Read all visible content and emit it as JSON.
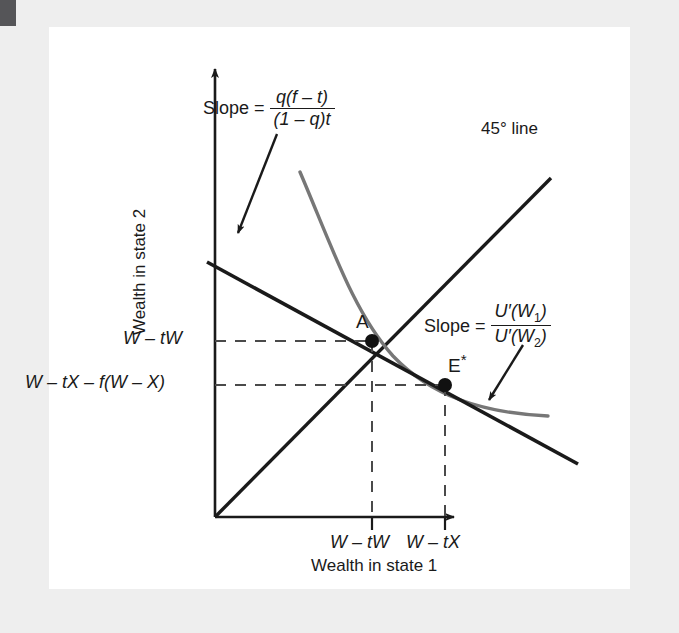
{
  "figure": {
    "type": "economics-diagram",
    "axes": {
      "x_title": "Wealth in state 1",
      "y_title": "Wealth in state 2",
      "x_ticks": [
        {
          "label_plain": "W – tW",
          "label_parts": [
            "W",
            "–",
            "t",
            "W"
          ],
          "x_px": 372
        },
        {
          "label_plain": "W – tX",
          "label_parts": [
            "W",
            "–",
            "t",
            "X"
          ],
          "x_px": 445
        }
      ],
      "y_ticks": [
        {
          "label_plain": "W – tW",
          "y_px": 341
        },
        {
          "label_plain": "W – tX – f(W – X)",
          "y_px": 385
        }
      ]
    },
    "lines": [
      {
        "name": "45-degree-line",
        "label": "45° line",
        "color": "#1a1a1a",
        "from": [
          215,
          517
        ],
        "to": [
          551,
          178
        ]
      },
      {
        "name": "budget-line",
        "color": "#1a1a1a",
        "from": [
          207,
          262
        ],
        "to": [
          578,
          464
        ]
      },
      {
        "name": "indifference-curve",
        "color": "#6e6e6e",
        "from": [
          300,
          172
        ],
        "to": [
          548,
          416
        ]
      }
    ],
    "points": [
      {
        "name": "A",
        "label": "A",
        "x_px": 372,
        "y_px": 341
      },
      {
        "name": "E-star",
        "label": "E",
        "superscript": "*",
        "x_px": 445,
        "y_px": 385
      }
    ],
    "annotations": {
      "slope_budget": {
        "prefix": "Slope =",
        "numerator": "q(f – t)",
        "denominator": "(1 – q)t",
        "arrow_from": [
          277,
          134
        ],
        "arrow_to": [
          238,
          233
        ]
      },
      "slope_indifference": {
        "prefix": "Slope =",
        "numerator": "U′(W1)",
        "denominator": "U′(W2)",
        "arrow_from": [
          523,
          345
        ],
        "arrow_to": [
          489,
          400
        ]
      },
      "line45_label": "45° line"
    }
  }
}
